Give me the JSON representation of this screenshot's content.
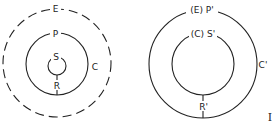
{
  "figures": [
    {
      "id": "left",
      "circles": [
        {
          "name": "E",
          "style": "dashed",
          "label": "E"
        },
        {
          "name": "P",
          "style": "solid",
          "label": "P",
          "side_label": "C"
        },
        {
          "name": "S",
          "style": "solid",
          "label": "S"
        }
      ],
      "connector_label": "R"
    },
    {
      "id": "right",
      "circles": [
        {
          "name": "outer",
          "style": "solid",
          "label": "(E) P'",
          "side_label": "C'"
        },
        {
          "name": "inner",
          "style": "solid",
          "label": "(C) S'"
        }
      ],
      "connector_label": "R'"
    }
  ],
  "corner_mark": "I"
}
